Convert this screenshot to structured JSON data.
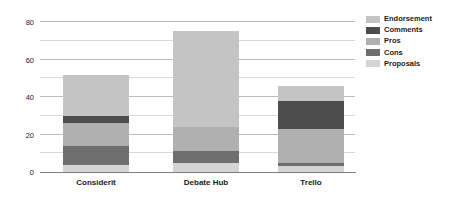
{
  "chart_data": {
    "type": "bar",
    "subtype": "stacked-bar",
    "title": "",
    "xlabel": "",
    "ylabel": "",
    "categories": [
      "Considerit",
      "Debate Hub",
      "Trello"
    ],
    "series": [
      {
        "name": "Proposals",
        "color": "#d4d4d4",
        "values": [
          4,
          5,
          3
        ]
      },
      {
        "name": "Cons",
        "color": "#6e6e6e",
        "values": [
          10,
          6,
          2
        ]
      },
      {
        "name": "Pros",
        "color": "#b0b0b0",
        "values": [
          12,
          13,
          18
        ]
      },
      {
        "name": "Comments",
        "color": "#4d4d4d",
        "values": [
          4,
          0,
          15
        ]
      },
      {
        "name": "Endorsement",
        "color": "#c4c4c4",
        "values": [
          22,
          51,
          8
        ]
      }
    ],
    "totals": [
      52,
      75,
      46
    ],
    "yticks": [
      0,
      20,
      40,
      60,
      80
    ],
    "ylim": [
      0,
      80
    ],
    "gridlines": [
      10,
      20,
      30,
      40,
      50,
      60,
      70,
      80
    ],
    "grid": true,
    "legend_position": "right",
    "legend_order": [
      "Endorsement",
      "Comments",
      "Pros",
      "Cons",
      "Proposals"
    ],
    "colors": {
      "endorsement": "#c4c4c4",
      "comments": "#4d4d4d",
      "pros": "#b0b0b0",
      "cons": "#6e6e6e",
      "proposals": "#d4d4d4",
      "gridline": "#d9d9d9",
      "axis": "#808080",
      "background": "#ffffff",
      "text": "#1a1a1a"
    }
  }
}
